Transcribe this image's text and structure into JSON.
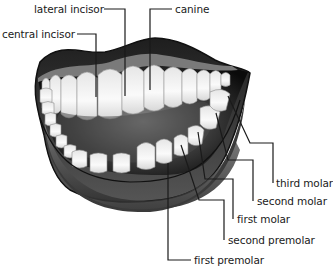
{
  "diagram": {
    "labels": [
      {
        "id": "lateral-incisor",
        "text": "lateral incisor",
        "x": 34,
        "y": 3
      },
      {
        "id": "canine",
        "text": "canine",
        "x": 175,
        "y": 3
      },
      {
        "id": "central-incisor",
        "text": "central incisor",
        "x": 2,
        "y": 28
      },
      {
        "id": "third-molar",
        "text": "third molar",
        "x": 276,
        "y": 177
      },
      {
        "id": "second-molar",
        "text": "second molar",
        "x": 257,
        "y": 195
      },
      {
        "id": "first-molar",
        "text": "first molar",
        "x": 237,
        "y": 213
      },
      {
        "id": "second-premolar",
        "text": "second premolar",
        "x": 228,
        "y": 234
      },
      {
        "id": "first-premolar",
        "text": "first premolar",
        "x": 194,
        "y": 254
      }
    ],
    "colors": {
      "lip_dark": "#2b2b2b",
      "lip_mid": "#6e6e6e",
      "gum": "#8a8a8a",
      "mouth_interior": "#111111",
      "tooth": "#f2f2f2",
      "tooth_shade": "#cfcfcf",
      "leader_line": "#1a1a1a"
    }
  }
}
